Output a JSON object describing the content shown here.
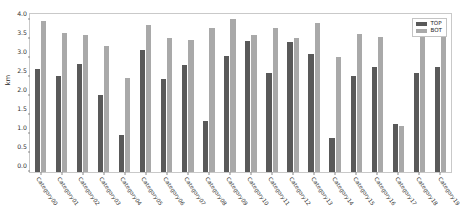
{
  "chart_data": {
    "type": "bar",
    "title": "",
    "xlabel": "",
    "ylabel": "km",
    "ylim": [
      0.0,
      4.15
    ],
    "yticks": [
      0.0,
      0.5,
      1.0,
      1.5,
      2.0,
      2.5,
      3.0,
      3.5,
      4.0
    ],
    "ytick_labels": [
      "0.0",
      "0.5",
      "1.0",
      "1.5",
      "2.0",
      "2.5",
      "3.0",
      "3.5",
      "4.0"
    ],
    "grid": false,
    "legend_position": "upper right",
    "categories": [
      "Category00",
      "Category01",
      "Category02",
      "Category03",
      "Category04",
      "Category05",
      "Category06",
      "Category07",
      "Category08",
      "Category09",
      "Category10",
      "Category11",
      "Category12",
      "Category13",
      "Category14",
      "Category15",
      "Category16",
      "Category17",
      "Category18",
      "Category19"
    ],
    "series": [
      {
        "name": "TOP",
        "color": "#595959",
        "values": [
          2.71,
          2.52,
          2.83,
          2.02,
          0.97,
          3.2,
          2.44,
          2.8,
          1.35,
          3.06,
          3.44,
          2.61,
          3.42,
          3.09,
          0.89,
          2.53,
          2.76,
          1.27,
          2.61,
          2.75
        ]
      },
      {
        "name": "BOT",
        "color": "#a9a9a9",
        "values": [
          3.97,
          3.64,
          3.59,
          3.3,
          2.46,
          3.87,
          3.51,
          3.48,
          3.77,
          4.01,
          3.6,
          3.77,
          3.52,
          3.91,
          3.02,
          3.62,
          3.54,
          1.22,
          3.68,
          3.79
        ]
      }
    ]
  },
  "legend": {
    "entries": [
      {
        "label": "TOP",
        "color": "#595959"
      },
      {
        "label": "BOT",
        "color": "#a9a9a9"
      }
    ]
  },
  "axes": {
    "y_axis_label": "km"
  }
}
